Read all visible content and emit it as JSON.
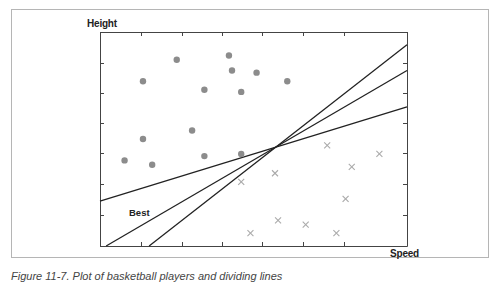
{
  "chart_data": {
    "type": "scatter",
    "title": "",
    "xlabel": "Speed",
    "ylabel": "Height",
    "grid": false,
    "legend": null,
    "axis_ticks_unlabeled": true,
    "xlim": [
      0,
      10
    ],
    "ylim": [
      0,
      10
    ],
    "series": [
      {
        "name": "class-a",
        "marker": "circle",
        "color": "#8c8c8c",
        "points": [
          [
            1.4,
            7.7
          ],
          [
            2.5,
            8.7
          ],
          [
            4.2,
            8.9
          ],
          [
            4.3,
            8.2
          ],
          [
            3.4,
            7.3
          ],
          [
            4.6,
            7.2
          ],
          [
            5.1,
            8.1
          ],
          [
            6.1,
            7.7
          ],
          [
            1.4,
            5.0
          ],
          [
            3.0,
            5.4
          ],
          [
            0.8,
            4.0
          ],
          [
            1.7,
            3.8
          ],
          [
            3.4,
            4.2
          ],
          [
            4.6,
            4.3
          ]
        ]
      },
      {
        "name": "class-b",
        "marker": "x",
        "color": "#aaaaaa",
        "points": [
          [
            7.4,
            4.7
          ],
          [
            4.6,
            3.0
          ],
          [
            5.7,
            3.4
          ],
          [
            8.2,
            3.7
          ],
          [
            9.1,
            4.3
          ],
          [
            8.0,
            2.2
          ],
          [
            5.8,
            1.2
          ],
          [
            6.7,
            1.0
          ],
          [
            4.9,
            0.6
          ],
          [
            7.7,
            0.6
          ]
        ]
      }
    ],
    "lines": [
      {
        "name": "shallow",
        "from": [
          0,
          2.1
        ],
        "to": [
          10,
          6.5
        ]
      },
      {
        "name": "Best",
        "from": [
          0.2,
          0
        ],
        "to": [
          10,
          8.2
        ]
      },
      {
        "name": "steep",
        "from": [
          1.6,
          0
        ],
        "to": [
          10,
          9.4
        ]
      }
    ],
    "annotations": [
      {
        "text": "Best",
        "x": 0.95,
        "y": 1.5
      }
    ]
  },
  "labels": {
    "y_axis": "Height",
    "x_axis": "Speed",
    "best_line": "Best",
    "caption": "Figure 11-7. Plot of basketball players and dividing lines"
  }
}
